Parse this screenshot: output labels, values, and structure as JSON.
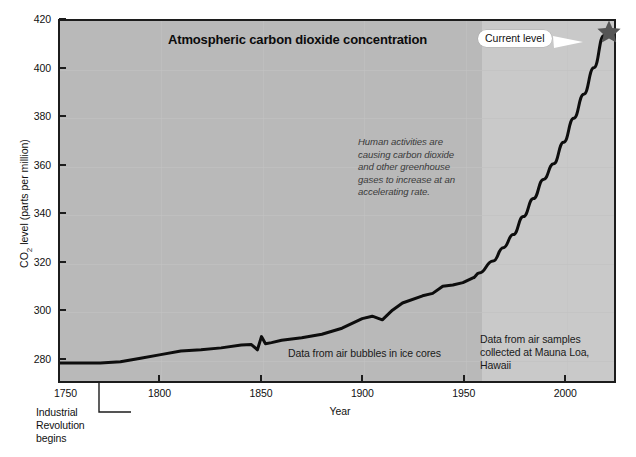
{
  "chart_data": {
    "type": "line",
    "title": "Atmospheric carbon dioxide concentration",
    "xlabel": "Year",
    "ylabel": "CO2 level (parts per million)",
    "ylabel_prefix": "CO",
    "ylabel_sub": "2",
    "ylabel_suffix": " level (parts per million)",
    "xlim": [
      1750,
      2025
    ],
    "ylim": [
      270,
      420
    ],
    "yticks": [
      280,
      300,
      320,
      340,
      360,
      380,
      400,
      420
    ],
    "xticks": [
      1750,
      1800,
      1850,
      1900,
      1950,
      2000
    ],
    "grid": true,
    "legend": "none",
    "series": [
      {
        "name": "CO2 concentration",
        "color": "#0d0d0d",
        "x": [
          1750,
          1760,
          1770,
          1780,
          1790,
          1800,
          1810,
          1820,
          1830,
          1840,
          1845,
          1848,
          1850,
          1852,
          1855,
          1860,
          1870,
          1880,
          1890,
          1900,
          1905,
          1910,
          1915,
          1920,
          1930,
          1935,
          1940,
          1945,
          1950,
          1955,
          1958,
          1965,
          1970,
          1975,
          1980,
          1985,
          1990,
          1995,
          2000,
          2005,
          2010,
          2015,
          2020
        ],
        "y": [
          277.5,
          277.5,
          277.5,
          278.0,
          279.5,
          281.0,
          282.5,
          283.0,
          283.8,
          285.0,
          285.2,
          283.0,
          288.5,
          285.5,
          286.0,
          287.0,
          288.0,
          289.5,
          292.0,
          296.0,
          297.0,
          295.5,
          299.5,
          302.5,
          305.5,
          306.5,
          309.5,
          310.0,
          311.0,
          313.0,
          315.0,
          320.0,
          325.5,
          331.0,
          338.5,
          346.0,
          354.0,
          360.5,
          369.5,
          379.5,
          389.5,
          400.5,
          414.0
        ]
      }
    ],
    "marker": {
      "name": "current-level",
      "label": "Current level",
      "x": 2020,
      "y": 414,
      "shape": "star",
      "color": "#555555"
    },
    "shaded_region": {
      "label": "Mauna Loa instrumental record",
      "x_start": 1958,
      "x_end": 2025,
      "color": "#c9c9c9"
    },
    "annotations": [
      {
        "name": "human-activities-note",
        "text": "Human activities are causing carbon dioxide and other greenhouse gases to increase at an accelerating rate.",
        "style": "italic"
      },
      {
        "name": "ice-core-source",
        "text": "Data from air bubbles in ice cores"
      },
      {
        "name": "mauna-loa-source",
        "text": "Data from air samples collected at Mauna Loa, Hawaii"
      },
      {
        "name": "industrial-revolution",
        "text": "Industrial Revolution begins",
        "x": 1770
      }
    ],
    "colors": {
      "plot_background": "#b9b9b9",
      "modern_band": "#c9c9c9",
      "line": "#0d0d0d",
      "star": "#555555",
      "axis": "#1c1c1c",
      "page_background": "#ffffff"
    }
  },
  "chart": {
    "title": "Atmospheric carbon dioxide concentration",
    "x_axis_title": "Year",
    "y_axis_label_prefix": "CO",
    "y_axis_label_sub": "2",
    "y_axis_label_suffix": " level (parts per million)"
  },
  "callout": {
    "current_level": "Current level"
  },
  "notes": {
    "human_activities": "Human activities are causing carbon dioxide and other greenhouse gases to increase at an accelerating rate.",
    "ice_cores": "Data from air bubbles in ice cores",
    "mauna_loa": "Data from air samples collected at Mauna Loa, Hawaii",
    "industrial_line1": "Industrial",
    "industrial_line2": "Revolution",
    "industrial_line3": "begins"
  }
}
